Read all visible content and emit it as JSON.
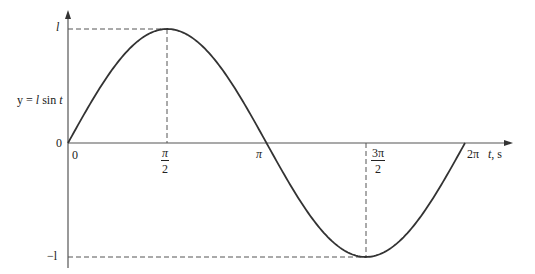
{
  "chart_data": {
    "type": "line",
    "title": "",
    "function_label": "y = l sin t",
    "xlabel": "t, s",
    "ylabel": "y = l sin t",
    "x_ticks": [
      "0",
      "π/2",
      "π",
      "3π/2",
      "2π"
    ],
    "x_tick_values": [
      0,
      1.5708,
      3.1416,
      4.7124,
      6.2832
    ],
    "y_ticks": [
      "l",
      "0",
      "−l"
    ],
    "y_tick_values": [
      1,
      0,
      -1
    ],
    "xlim": [
      0,
      6.2832
    ],
    "ylim": [
      -1,
      1
    ],
    "grid": false,
    "legend": null,
    "series": [
      {
        "name": "y = l sin t",
        "x": [
          0,
          0.7854,
          1.5708,
          2.3562,
          3.1416,
          3.927,
          4.7124,
          5.4978,
          6.2832
        ],
        "y": [
          0,
          0.7071,
          1,
          0.7071,
          0,
          -0.7071,
          -1,
          -0.7071,
          0
        ]
      }
    ],
    "annotations": [
      {
        "type": "dashed-guide",
        "from": "y-axis at l",
        "to": "peak at t=π/2",
        "then": "down to x-axis"
      },
      {
        "type": "dashed-guide",
        "from": "y-axis at −l",
        "to": "trough at t=3π/2",
        "then": "up to x-axis"
      }
    ]
  },
  "labels": {
    "y_max": "l",
    "y_min": "−l",
    "y_zero": "0",
    "x_zero": "0",
    "func_y": "y",
    "func_eq": " = ",
    "func_l": "l",
    "func_sin": " sin ",
    "func_t": "t",
    "pi_half_num": "π",
    "pi_half_den": "2",
    "pi": "π",
    "three_pi_half_num": "3π",
    "three_pi_half_den": "2",
    "two_pi": "2π",
    "x_axis_var": "t",
    "x_axis_unit": ", s"
  },
  "colors": {
    "curve": "#333333",
    "axes": "#555555",
    "guides": "#555555",
    "text": "#222222"
  }
}
